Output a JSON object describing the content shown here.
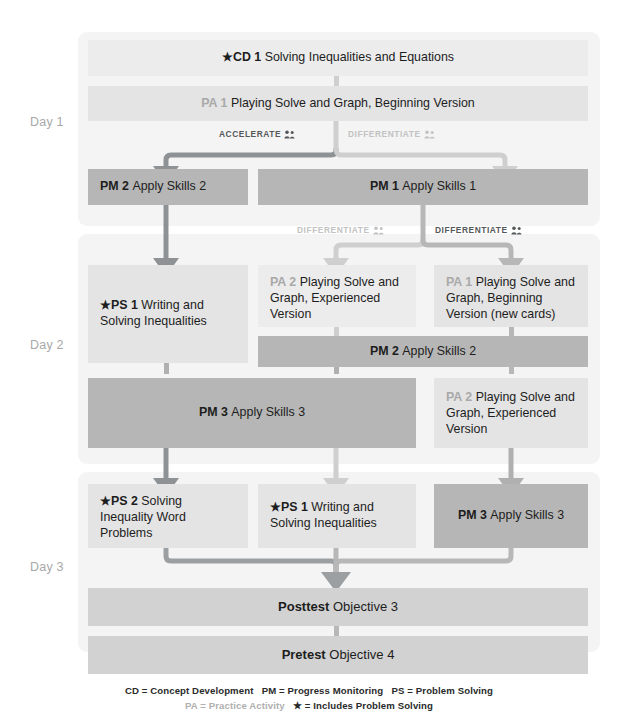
{
  "diagram": {
    "title_strip": "",
    "days": [
      {
        "id": "day1",
        "label": "Day 1"
      },
      {
        "id": "day2",
        "label": "Day 2"
      },
      {
        "id": "day3",
        "label": "Day 3"
      }
    ],
    "nodes": [
      {
        "id": "cd1",
        "code": "★CD 1",
        "title": "Solving Inequalities and Equations"
      },
      {
        "id": "pa1-top",
        "code": "PA 1",
        "title": "Playing Solve and Graph, Beginning Version"
      },
      {
        "id": "pm2-left",
        "code": "PM 2",
        "title": "Apply Skills 2"
      },
      {
        "id": "pm1",
        "code": "PM 1",
        "title": "Apply Skills 1"
      },
      {
        "id": "ps1-d2",
        "code": "★PS 1",
        "title": "Writing and Solving Inequalities"
      },
      {
        "id": "pa2-mid",
        "code": "PA 2",
        "title": "Playing Solve and Graph, Experienced Version"
      },
      {
        "id": "pa1-right",
        "code": "PA 1",
        "title": "Playing Solve and Graph, Beginning Version (new cards)"
      },
      {
        "id": "pm2-d2",
        "code": "PM 2",
        "title": "Apply Skills 2"
      },
      {
        "id": "pm3-d2",
        "code": "PM 3",
        "title": "Apply Skills 3"
      },
      {
        "id": "pa2-right",
        "code": "PA 2",
        "title": "Playing Solve and Graph, Experienced Version"
      },
      {
        "id": "ps2-d3",
        "code": "★PS 2",
        "title": "Solving Inequality Word Problems"
      },
      {
        "id": "ps1-d3",
        "code": "★PS 1",
        "title": "Writing and Solving Inequalities"
      },
      {
        "id": "pm3-d3",
        "code": "PM 3",
        "title": "Apply Skills 3"
      },
      {
        "id": "posttest",
        "code": "Posttest",
        "title": "Objective 3"
      },
      {
        "id": "pretest",
        "code": "Pretest",
        "title": "Objective 4"
      }
    ],
    "branch_labels": [
      {
        "id": "accelerate-d1",
        "text": "ACCELERATE",
        "icon": "two-people-icon"
      },
      {
        "id": "differentiate-d1",
        "text": "DIFFERENTIATE",
        "icon": "two-people-icon"
      },
      {
        "id": "differentiate-d2a",
        "text": "DIFFERENTIATE",
        "icon": "two-people-icon"
      },
      {
        "id": "differentiate-d2b",
        "text": "DIFFERENTIATE",
        "icon": "two-people-icon"
      }
    ],
    "legend": {
      "line1_a": "CD = Concept Development",
      "line1_b": "PM = Progress Monitoring",
      "line1_c": "PS = Problem Solving",
      "line2_a": "PA = Practice Activity",
      "line2_b": "★ = Includes Problem Solving"
    },
    "colors": {
      "panel": "#f4f4f4",
      "node_dark": "#b6b6b6",
      "node_mid": "#d2d2d2",
      "node_light": "#e4e4e4",
      "node_pale": "#ececec",
      "arrow_dark": "#8e9294",
      "arrow_light": "#cfcfcf",
      "text": "#1d1d1d",
      "dim_text": "#a9a9a9"
    }
  }
}
